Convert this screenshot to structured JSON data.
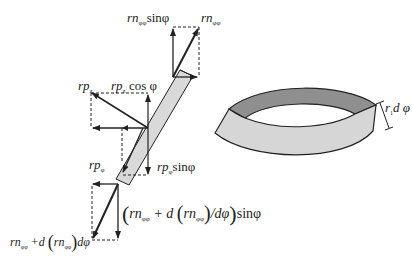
{
  "diagram": {
    "colors": {
      "line": "#222222",
      "bar_fill": "#d9d9d9",
      "ring_outer_fill": "#d6d6d6",
      "ring_inner_fill": "#8f8f8f",
      "background": "#ffffff"
    },
    "labels": {
      "top_vertical": {
        "main": "rn",
        "sub": "φφ",
        "tail": "sinφ"
      },
      "top_resultant": {
        "main": "rn",
        "sub": "φφ"
      },
      "mid_pressure_z": {
        "main": "rp",
        "sub": "z"
      },
      "mid_pressure_z_cos": {
        "main": "rp",
        "sub": "z",
        "tail": " cos φ"
      },
      "low_pressure_phi": {
        "main": "rp",
        "sub": "φ"
      },
      "low_pressure_phi_sin": {
        "main": "rp",
        "sub": "φ",
        "tail": "sinφ"
      },
      "bottom_vertical": {
        "open": "(",
        "part1_main": "rn",
        "part1_sub": "φφ",
        "plus": " + d ",
        "inner_open": "(",
        "part2_main": "rn",
        "part2_sub": "φφ",
        "inner_close": ")",
        "frac": "/dφ",
        "close": ")",
        "tail": "sinφ"
      },
      "bottom_resultant": {
        "part1_main": "rn",
        "part1_sub": "φφ",
        "plus": " +d ",
        "inner_open": "(",
        "part2_main": "rn",
        "part2_sub": "φφ",
        "inner_close": ")",
        "tail": "dφ"
      },
      "ring_width": {
        "main": "r",
        "sub": "1",
        "tail": "d φ"
      }
    }
  }
}
